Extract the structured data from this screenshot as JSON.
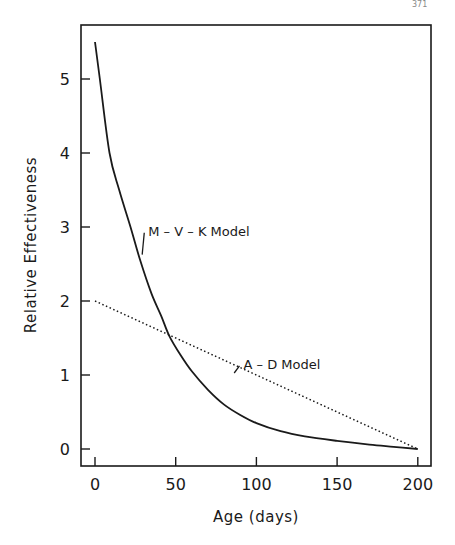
{
  "page_mark": "371",
  "chart_data": {
    "type": "line",
    "title": "",
    "xlabel": "Age (days)",
    "ylabel": "Relative Effectiveness",
    "xlim": [
      -8,
      208
    ],
    "ylim": [
      -0.23,
      5.7
    ],
    "xticks": [
      0,
      50,
      100,
      150,
      200
    ],
    "yticks": [
      0,
      1,
      2,
      3,
      4,
      5
    ],
    "xtick_labels": [
      "0",
      "50",
      "100",
      "150",
      "200"
    ],
    "ytick_labels": [
      "0",
      "1",
      "2",
      "3",
      "4",
      "5"
    ],
    "grid": false,
    "legend": "none (inline annotations)",
    "series": [
      {
        "name": "M-V-K Model",
        "style": "solid",
        "x": [
          0,
          3,
          9,
          15,
          22,
          28,
          35,
          41,
          46,
          53,
          60,
          70,
          80,
          90,
          100,
          115,
          130,
          150,
          170,
          185,
          200
        ],
        "values": [
          5.5,
          5.0,
          4.0,
          3.5,
          3.0,
          2.55,
          2.1,
          1.8,
          1.53,
          1.27,
          1.05,
          0.8,
          0.6,
          0.46,
          0.35,
          0.24,
          0.17,
          0.11,
          0.06,
          0.03,
          0.0
        ]
      },
      {
        "name": "A-D Model",
        "style": "dotted",
        "x": [
          0,
          200
        ],
        "values": [
          2.0,
          0.0
        ]
      }
    ],
    "annotations": [
      {
        "text": "M-V-K Model",
        "x": 33,
        "y": 2.95,
        "leader_to": [
          28,
          2.6
        ]
      },
      {
        "text": "A-D Model",
        "x": 92,
        "y": 1.15,
        "leader_to": [
          85,
          1.0
        ]
      }
    ]
  }
}
